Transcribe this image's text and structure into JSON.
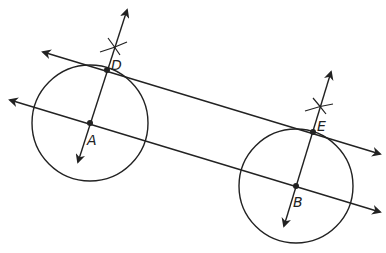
{
  "diagram": {
    "stroke_color": "#222222",
    "background": "#ffffff",
    "points": [
      {
        "id": "D",
        "label": "D",
        "x": 107,
        "y": 70,
        "label_x": 111,
        "label_y": 70
      },
      {
        "id": "A",
        "label": "A",
        "x": 90,
        "y": 123,
        "label_x": 87,
        "label_y": 145
      },
      {
        "id": "E",
        "label": "E",
        "x": 313,
        "y": 132,
        "label_x": 317,
        "label_y": 131
      },
      {
        "id": "B",
        "label": "B",
        "x": 296,
        "y": 186,
        "label_x": 293,
        "label_y": 207
      }
    ],
    "circles": [
      {
        "id": "circle-A",
        "cx": 90,
        "cy": 123,
        "r": 58
      },
      {
        "id": "circle-B",
        "cx": 296,
        "cy": 186,
        "r": 57
      }
    ],
    "lines": [
      {
        "id": "line-DE",
        "x1": 43,
        "y1": 52,
        "x2": 380,
        "y2": 154
      },
      {
        "id": "line-AB",
        "x1": 10,
        "y1": 100,
        "x2": 380,
        "y2": 212
      },
      {
        "id": "perp-AD",
        "x1": 78,
        "y1": 162,
        "x2": 127,
        "y2": 10
      },
      {
        "id": "perp-BE",
        "x1": 284,
        "y1": 226,
        "x2": 331,
        "y2": 72
      }
    ],
    "arc_marks": [
      {
        "id": "arc-D-1",
        "d": "M100 52 Q114 48 127 42"
      },
      {
        "id": "arc-D-2",
        "d": "M108 38 Q114 46 120 55"
      },
      {
        "id": "arc-E-1",
        "d": "M305 111 Q319 106 333 104"
      },
      {
        "id": "arc-E-2",
        "d": "M313 98 Q319 105 326 114"
      }
    ]
  }
}
